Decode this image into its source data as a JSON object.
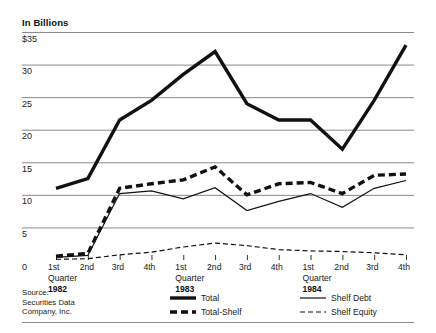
{
  "chart_data": {
    "type": "line",
    "title": "In Billions",
    "xlabel": "",
    "ylabel": "",
    "ylim": [
      0,
      35
    ],
    "yticks": [
      0,
      5,
      10,
      15,
      20,
      25,
      30,
      35
    ],
    "ytick_labels": [
      "0",
      "5",
      "10",
      "15",
      "20",
      "25",
      "30",
      "$35"
    ],
    "grid": true,
    "legend_position": "bottom",
    "categories": [
      "1st Quarter 1982",
      "2nd 1982",
      "3rd 1982",
      "4th 1982",
      "1st Quarter 1983",
      "2nd 1983",
      "3rd 1983",
      "4th 1983",
      "1st Quarter 1984",
      "2nd 1984",
      "3rd 1984",
      "4th 1984"
    ],
    "x_groups": [
      {
        "year": "1982",
        "quarters": [
          "1st",
          "2nd",
          "3rd",
          "4th"
        ],
        "group_label": "Quarter"
      },
      {
        "year": "1983",
        "quarters": [
          "1st",
          "2nd",
          "3rd",
          "4th"
        ],
        "group_label": "Quarter"
      },
      {
        "year": "1984",
        "quarters": [
          "1st",
          "2nd",
          "3rd",
          "4th"
        ],
        "group_label": "Quarter"
      }
    ],
    "series": [
      {
        "name": "Total",
        "style": "thick-solid",
        "color": "#111111",
        "values": [
          11.0,
          12.5,
          21.5,
          24.5,
          28.5,
          32.0,
          24.0,
          21.5,
          21.5,
          17.0,
          24.5,
          33.0
        ]
      },
      {
        "name": "Total-Shelf",
        "style": "thick-dashed",
        "color": "#111111",
        "values": [
          0.6,
          1.0,
          11.0,
          11.7,
          12.3,
          14.3,
          10.0,
          11.7,
          11.9,
          10.2,
          13.0,
          13.2
        ]
      },
      {
        "name": "Shelf Debt",
        "style": "thin-solid",
        "color": "#111111",
        "values": [
          0.4,
          0.7,
          10.2,
          10.6,
          9.4,
          11.1,
          7.6,
          9.0,
          10.2,
          8.1,
          11.0,
          12.2
        ]
      },
      {
        "name": "Shelf Equity",
        "style": "thin-dashed",
        "color": "#111111",
        "values": [
          0.1,
          0.2,
          0.8,
          1.2,
          2.0,
          2.6,
          2.2,
          1.6,
          1.4,
          1.3,
          1.1,
          0.8
        ]
      }
    ]
  },
  "source": {
    "line1": "Source:",
    "line2": "Securities Data",
    "line3": "Company, Inc."
  },
  "legend": {
    "items": [
      {
        "label": "Total",
        "style": "thick-solid"
      },
      {
        "label": "Total-Shelf",
        "style": "thick-dashed"
      },
      {
        "label": "Shelf Debt",
        "style": "thin-solid"
      },
      {
        "label": "Shelf Equity",
        "style": "thin-dashed"
      }
    ]
  },
  "colors": {
    "ink": "#111111",
    "grid": "#8a8a8a",
    "background": "#ffffff"
  }
}
